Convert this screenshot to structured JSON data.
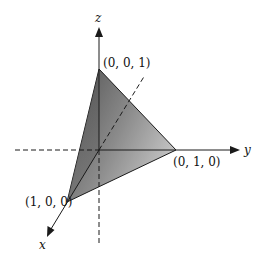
{
  "diagram": {
    "type": "3d-coordinate-plane",
    "axes": {
      "x": {
        "label": "x"
      },
      "y": {
        "label": "y"
      },
      "z": {
        "label": "z"
      }
    },
    "vertices": [
      {
        "label": "(1, 0, 0)"
      },
      {
        "label": "(0, 1, 0)"
      },
      {
        "label": "(0, 0, 1)"
      }
    ],
    "colors": {
      "face_dark": "#5a5a5a",
      "face_light": "#b0b0b0",
      "line": "#1a1a1a"
    }
  }
}
